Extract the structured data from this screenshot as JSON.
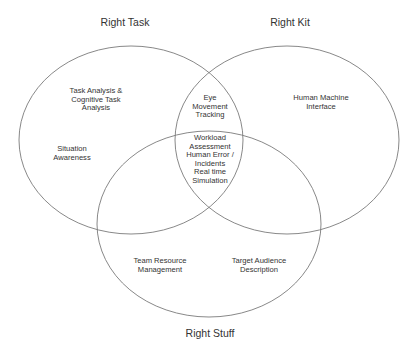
{
  "diagram": {
    "type": "venn",
    "line_color": "#7a7a7a",
    "text_color": "#333333",
    "background": "#ffffff",
    "sets": [
      {
        "id": "task",
        "title": "Right Task",
        "ellipse": {
          "cx": 131,
          "cy": 140,
          "rx": 112,
          "ry": 94
        },
        "title_pos": {
          "x": 125,
          "y": 16
        }
      },
      {
        "id": "kit",
        "title": "Right Kit",
        "ellipse": {
          "cx": 287,
          "cy": 140,
          "rx": 112,
          "ry": 94
        },
        "title_pos": {
          "x": 290,
          "y": 16
        }
      },
      {
        "id": "stuff",
        "title": "Right Stuff",
        "ellipse": {
          "cx": 209,
          "cy": 224,
          "rx": 112,
          "ry": 93
        },
        "title_pos": {
          "x": 210,
          "y": 327
        }
      }
    ],
    "regions": [
      {
        "id": "task-only-1",
        "sets": [
          "task"
        ],
        "text": "Task Analysis &\nCognitive Task\nAnalysis",
        "pos": {
          "x": 96,
          "y": 87
        }
      },
      {
        "id": "task-only-2",
        "sets": [
          "task"
        ],
        "text": "Situation\nAwareness",
        "pos": {
          "x": 72,
          "y": 145
        }
      },
      {
        "id": "task-kit",
        "sets": [
          "task",
          "kit"
        ],
        "text": "Eye\nMovement\nTracking",
        "pos": {
          "x": 210,
          "y": 94
        }
      },
      {
        "id": "kit-only",
        "sets": [
          "kit"
        ],
        "text": "Human Machine\nInterface",
        "pos": {
          "x": 321,
          "y": 94
        }
      },
      {
        "id": "all-three",
        "sets": [
          "task",
          "kit",
          "stuff"
        ],
        "text": "Workload\nAssessment\nHuman Error /\nIncidents\nReal time\nSimulation",
        "pos": {
          "x": 210,
          "y": 134
        }
      },
      {
        "id": "stuff-only-1",
        "sets": [
          "stuff"
        ],
        "text": "Team Resource\nManagement",
        "pos": {
          "x": 160,
          "y": 257
        }
      },
      {
        "id": "stuff-only-2",
        "sets": [
          "stuff"
        ],
        "text": "Target Audience\nDescription",
        "pos": {
          "x": 259,
          "y": 257
        }
      }
    ]
  }
}
